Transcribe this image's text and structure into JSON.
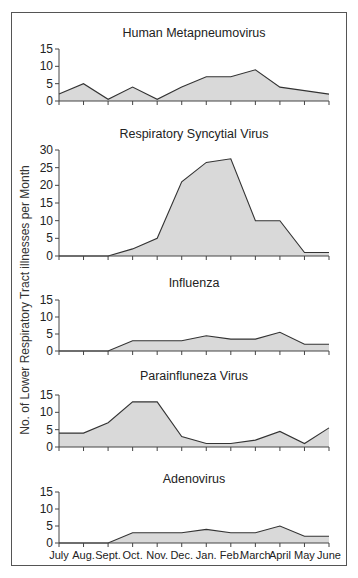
{
  "figure": {
    "ylabel": "No. of Lower Respiratory Tract illnesses per Month"
  },
  "chart_data": [
    {
      "type": "area",
      "title": "Human Metapneumovirus",
      "xlabel": "",
      "ylabel": "No. of Lower Respiratory Tract illnesses per Month",
      "categories": [
        "July",
        "Aug.",
        "Sept.",
        "Oct.",
        "Nov.",
        "Dec.",
        "Jan.",
        "Feb.",
        "March",
        "April",
        "May",
        "June"
      ],
      "values": [
        2,
        5,
        0.5,
        4,
        0.5,
        4,
        7,
        7,
        9,
        4,
        3,
        2
      ],
      "ylim": [
        0,
        15
      ],
      "yticks": [
        0,
        5,
        10,
        15
      ],
      "grid": false
    },
    {
      "type": "area",
      "title": "Respiratory Syncytial Virus",
      "xlabel": "",
      "ylabel": "No. of Lower Respiratory Tract illnesses per Month",
      "categories": [
        "July",
        "Aug.",
        "Sept.",
        "Oct.",
        "Nov.",
        "Dec.",
        "Jan.",
        "Feb.",
        "March",
        "April",
        "May",
        "June"
      ],
      "values": [
        0,
        0,
        0,
        2,
        5,
        21,
        26.5,
        27.5,
        10,
        10,
        1,
        1
      ],
      "ylim": [
        0,
        30
      ],
      "yticks": [
        0,
        5,
        10,
        15,
        20,
        25,
        30
      ],
      "grid": false
    },
    {
      "type": "area",
      "title": "Influenza",
      "xlabel": "",
      "ylabel": "No. of Lower Respiratory Tract illnesses per Month",
      "categories": [
        "July",
        "Aug.",
        "Sept.",
        "Oct.",
        "Nov.",
        "Dec.",
        "Jan.",
        "Feb.",
        "March",
        "April",
        "May",
        "June"
      ],
      "values": [
        0,
        0,
        0,
        3,
        3,
        3,
        4.5,
        3.5,
        3.5,
        5.5,
        2,
        2
      ],
      "ylim": [
        0,
        15
      ],
      "yticks": [
        0,
        5,
        10,
        15
      ],
      "grid": false
    },
    {
      "type": "area",
      "title": "Parainfluneza Virus",
      "xlabel": "",
      "ylabel": "No. of Lower Respiratory Tract illnesses per Month",
      "categories": [
        "July",
        "Aug.",
        "Sept.",
        "Oct.",
        "Nov.",
        "Dec.",
        "Jan.",
        "Feb.",
        "March",
        "April",
        "May",
        "June"
      ],
      "values": [
        4,
        4,
        7,
        13,
        13,
        3,
        1,
        1,
        2,
        4.5,
        1,
        5.5
      ],
      "ylim": [
        0,
        15
      ],
      "yticks": [
        0,
        5,
        10,
        15
      ],
      "grid": false
    },
    {
      "type": "area",
      "title": "Adenovirus",
      "xlabel": "",
      "ylabel": "No. of Lower Respiratory Tract illnesses per Month",
      "categories": [
        "July",
        "Aug.",
        "Sept.",
        "Oct.",
        "Nov.",
        "Dec.",
        "Jan.",
        "Feb.",
        "March",
        "April",
        "May",
        "June"
      ],
      "values": [
        0,
        0,
        0,
        3,
        3,
        3,
        4,
        3,
        3,
        5,
        2,
        2
      ],
      "ylim": [
        0,
        15
      ],
      "yticks": [
        0,
        5,
        10,
        15
      ],
      "grid": false
    }
  ],
  "colors": {
    "fill": "#d9d9d9",
    "line": "#333333",
    "axis": "#444444"
  }
}
